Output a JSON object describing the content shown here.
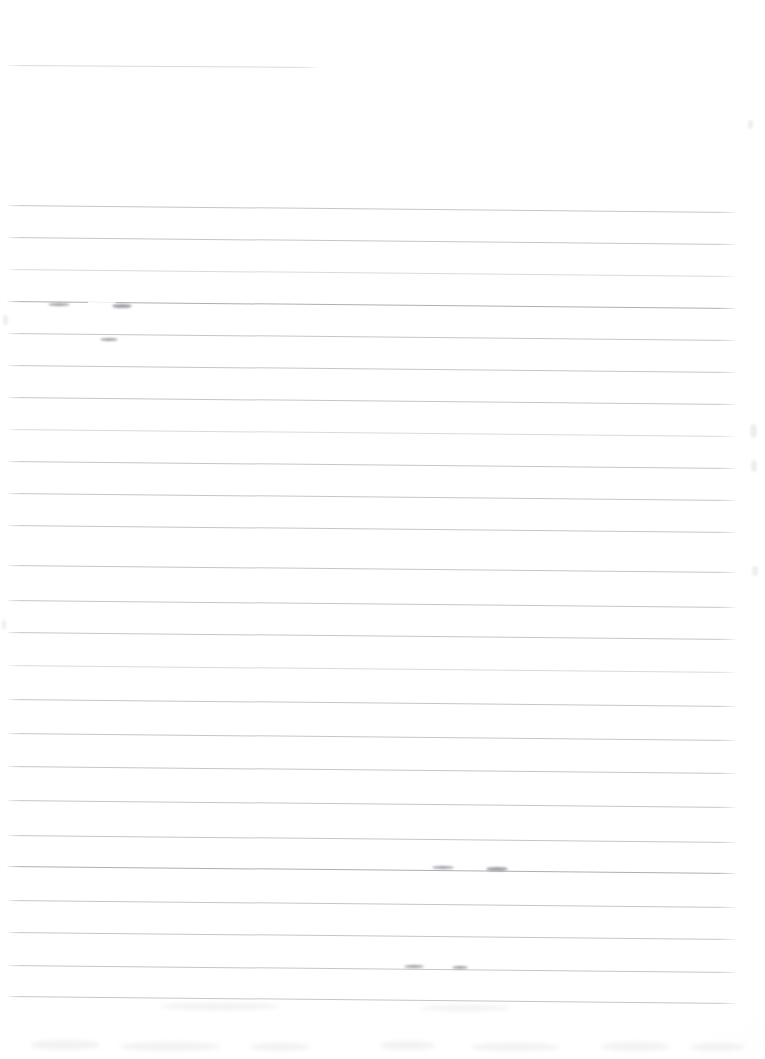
{
  "document": {
    "kind": "scanned-ruled-notebook-page",
    "title": "",
    "written_text": "",
    "page_width": 765,
    "page_height": 1059,
    "background_color": "#fefefe",
    "rule_color": "#b9bcc2",
    "rule_color_faint": "#cfd2d7",
    "rule_color_strong": "#a7abb2",
    "mark_color": "#7e828a",
    "rule_count": 25,
    "rule_spacing_px": 31.7,
    "rule_slope_deg": 0.55,
    "notes": "Blank lined page; no handwriting, no printed text, no headings or numbers are visible."
  },
  "header_rule": {
    "x": 8,
    "y": 65,
    "width": 308,
    "slope_deg": 0.35,
    "weight": "faint"
  },
  "rules": [
    {
      "x": 7,
      "y": 205,
      "width": 728,
      "slope_deg": 0.55,
      "weight": "normal"
    },
    {
      "x": 7,
      "y": 237,
      "width": 728,
      "slope_deg": 0.55,
      "weight": "normal"
    },
    {
      "x": 7,
      "y": 269,
      "width": 728,
      "slope_deg": 0.55,
      "weight": "faint"
    },
    {
      "x": 7,
      "y": 301,
      "width": 728,
      "slope_deg": 0.55,
      "weight": "strong"
    },
    {
      "x": 7,
      "y": 333,
      "width": 728,
      "slope_deg": 0.55,
      "weight": "normal"
    },
    {
      "x": 7,
      "y": 365,
      "width": 728,
      "slope_deg": 0.55,
      "weight": "normal"
    },
    {
      "x": 7,
      "y": 397,
      "width": 728,
      "slope_deg": 0.55,
      "weight": "normal"
    },
    {
      "x": 7,
      "y": 429,
      "width": 728,
      "slope_deg": 0.55,
      "weight": "faint"
    },
    {
      "x": 7,
      "y": 461,
      "width": 728,
      "slope_deg": 0.55,
      "weight": "normal"
    },
    {
      "x": 7,
      "y": 493,
      "width": 728,
      "slope_deg": 0.55,
      "weight": "normal"
    },
    {
      "x": 7,
      "y": 525,
      "width": 728,
      "slope_deg": 0.55,
      "weight": "normal"
    },
    {
      "x": 7,
      "y": 565,
      "width": 728,
      "slope_deg": 0.55,
      "weight": "normal"
    },
    {
      "x": 7,
      "y": 600,
      "width": 728,
      "slope_deg": 0.55,
      "weight": "normal"
    },
    {
      "x": 7,
      "y": 632,
      "width": 728,
      "slope_deg": 0.55,
      "weight": "normal"
    },
    {
      "x": 7,
      "y": 665,
      "width": 728,
      "slope_deg": 0.55,
      "weight": "faint"
    },
    {
      "x": 7,
      "y": 699,
      "width": 728,
      "slope_deg": 0.55,
      "weight": "normal"
    },
    {
      "x": 7,
      "y": 733,
      "width": 728,
      "slope_deg": 0.55,
      "weight": "normal"
    },
    {
      "x": 7,
      "y": 766,
      "width": 728,
      "slope_deg": 0.55,
      "weight": "normal"
    },
    {
      "x": 7,
      "y": 800,
      "width": 728,
      "slope_deg": 0.55,
      "weight": "normal"
    },
    {
      "x": 7,
      "y": 835,
      "width": 728,
      "slope_deg": 0.55,
      "weight": "normal"
    },
    {
      "x": 7,
      "y": 866,
      "width": 728,
      "slope_deg": 0.55,
      "weight": "strong"
    },
    {
      "x": 7,
      "y": 900,
      "width": 728,
      "slope_deg": 0.55,
      "weight": "normal"
    },
    {
      "x": 7,
      "y": 932,
      "width": 728,
      "slope_deg": 0.55,
      "weight": "normal"
    },
    {
      "x": 7,
      "y": 965,
      "width": 728,
      "slope_deg": 0.55,
      "weight": "normal"
    },
    {
      "x": 7,
      "y": 996,
      "width": 728,
      "slope_deg": 0.55,
      "weight": "normal"
    }
  ],
  "rule_gaps": [
    {
      "x": 88,
      "y": 303,
      "width": 28,
      "slope_deg": 0.55
    },
    {
      "x": 108,
      "y": 337,
      "width": 24,
      "slope_deg": 0.55
    },
    {
      "x": 448,
      "y": 866,
      "width": 40,
      "slope_deg": 0.55
    },
    {
      "x": 428,
      "y": 965,
      "width": 22,
      "slope_deg": 0.55
    }
  ],
  "marks": [
    {
      "x": 48,
      "y": 304,
      "width": 22,
      "height": 3
    },
    {
      "x": 112,
      "y": 306,
      "width": 20,
      "height": 4
    },
    {
      "x": 100,
      "y": 339,
      "width": 18,
      "height": 3
    },
    {
      "x": 432,
      "y": 867,
      "width": 22,
      "height": 3
    },
    {
      "x": 486,
      "y": 869,
      "width": 22,
      "height": 4
    },
    {
      "x": 404,
      "y": 966,
      "width": 20,
      "height": 3
    },
    {
      "x": 452,
      "y": 967,
      "width": 16,
      "height": 3
    }
  ],
  "speckles": [
    {
      "x": 750,
      "y": 424,
      "width": 7,
      "height": 14
    },
    {
      "x": 751,
      "y": 460,
      "width": 6,
      "height": 12
    },
    {
      "x": 752,
      "y": 566,
      "width": 6,
      "height": 10
    },
    {
      "x": 748,
      "y": 120,
      "width": 5,
      "height": 9
    },
    {
      "x": 3,
      "y": 315,
      "width": 5,
      "height": 10
    },
    {
      "x": 2,
      "y": 620,
      "width": 4,
      "height": 9
    }
  ],
  "smudges": [
    {
      "x": 30,
      "y": 1040,
      "width": 70,
      "height": 10
    },
    {
      "x": 120,
      "y": 1042,
      "width": 100,
      "height": 9
    },
    {
      "x": 250,
      "y": 1043,
      "width": 60,
      "height": 8
    },
    {
      "x": 380,
      "y": 1041,
      "width": 55,
      "height": 9
    },
    {
      "x": 470,
      "y": 1043,
      "width": 90,
      "height": 8
    },
    {
      "x": 600,
      "y": 1042,
      "width": 70,
      "height": 9
    },
    {
      "x": 690,
      "y": 1043,
      "width": 55,
      "height": 8
    },
    {
      "x": 160,
      "y": 1003,
      "width": 120,
      "height": 7
    },
    {
      "x": 420,
      "y": 1005,
      "width": 90,
      "height": 6
    }
  ]
}
